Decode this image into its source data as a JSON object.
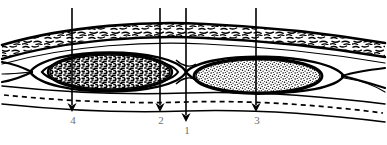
{
  "figure": {
    "name": "histology-cross-section-diagram",
    "background_color": "#ffffff",
    "ink_color": "#000000",
    "label_color": "#6f6f6f",
    "canvas": {
      "width": 387,
      "height": 145
    }
  },
  "callouts": [
    {
      "id": "callout-4",
      "label": "4",
      "line_x": 72,
      "line_top": 8,
      "tip_y": 112,
      "label_x": 66,
      "label_y": 115,
      "target": "dark-oval-interior"
    },
    {
      "id": "callout-2",
      "label": "2",
      "line_x": 160,
      "line_top": 8,
      "tip_y": 112,
      "label_x": 154,
      "label_y": 115,
      "target": "dark-oval-capsule-edge"
    },
    {
      "id": "callout-1",
      "label": "1",
      "line_x": 186,
      "line_top": 8,
      "tip_y": 122,
      "label_x": 180,
      "label_y": 125,
      "target": "junction-between-ovals"
    },
    {
      "id": "callout-3",
      "label": "3",
      "line_x": 256,
      "line_top": 8,
      "tip_y": 112,
      "label_x": 250,
      "label_y": 115,
      "target": "light-oval-interior"
    }
  ],
  "structures": [
    {
      "id": "upper-fibrous-band",
      "name": "upper-fibrous-band",
      "texture": "dashes",
      "description": "Upper hatched fibrous connective tissue band spanning the full width"
    },
    {
      "id": "dark-oval",
      "name": "dark-stippled-oval",
      "texture": "dense-dark-stipple",
      "capsule_layers": 3,
      "side": "left",
      "description": "Left oval with dense dark granular fill and concentric capsule rings"
    },
    {
      "id": "light-oval",
      "name": "light-stippled-oval",
      "texture": "fine-light-stipple",
      "capsule_layers": 2,
      "side": "right",
      "description": "Right oval with fine light granular fill and single capsule ring"
    },
    {
      "id": "lower-band",
      "name": "lower-tissue-band",
      "texture": "plain",
      "description": "Lower plain tissue band beneath the ovals"
    },
    {
      "id": "dashed-baseline",
      "name": "dashed-baseline",
      "texture": "dashed-line",
      "description": "Long dashed horizontal boundary line near the bottom of the section"
    }
  ]
}
